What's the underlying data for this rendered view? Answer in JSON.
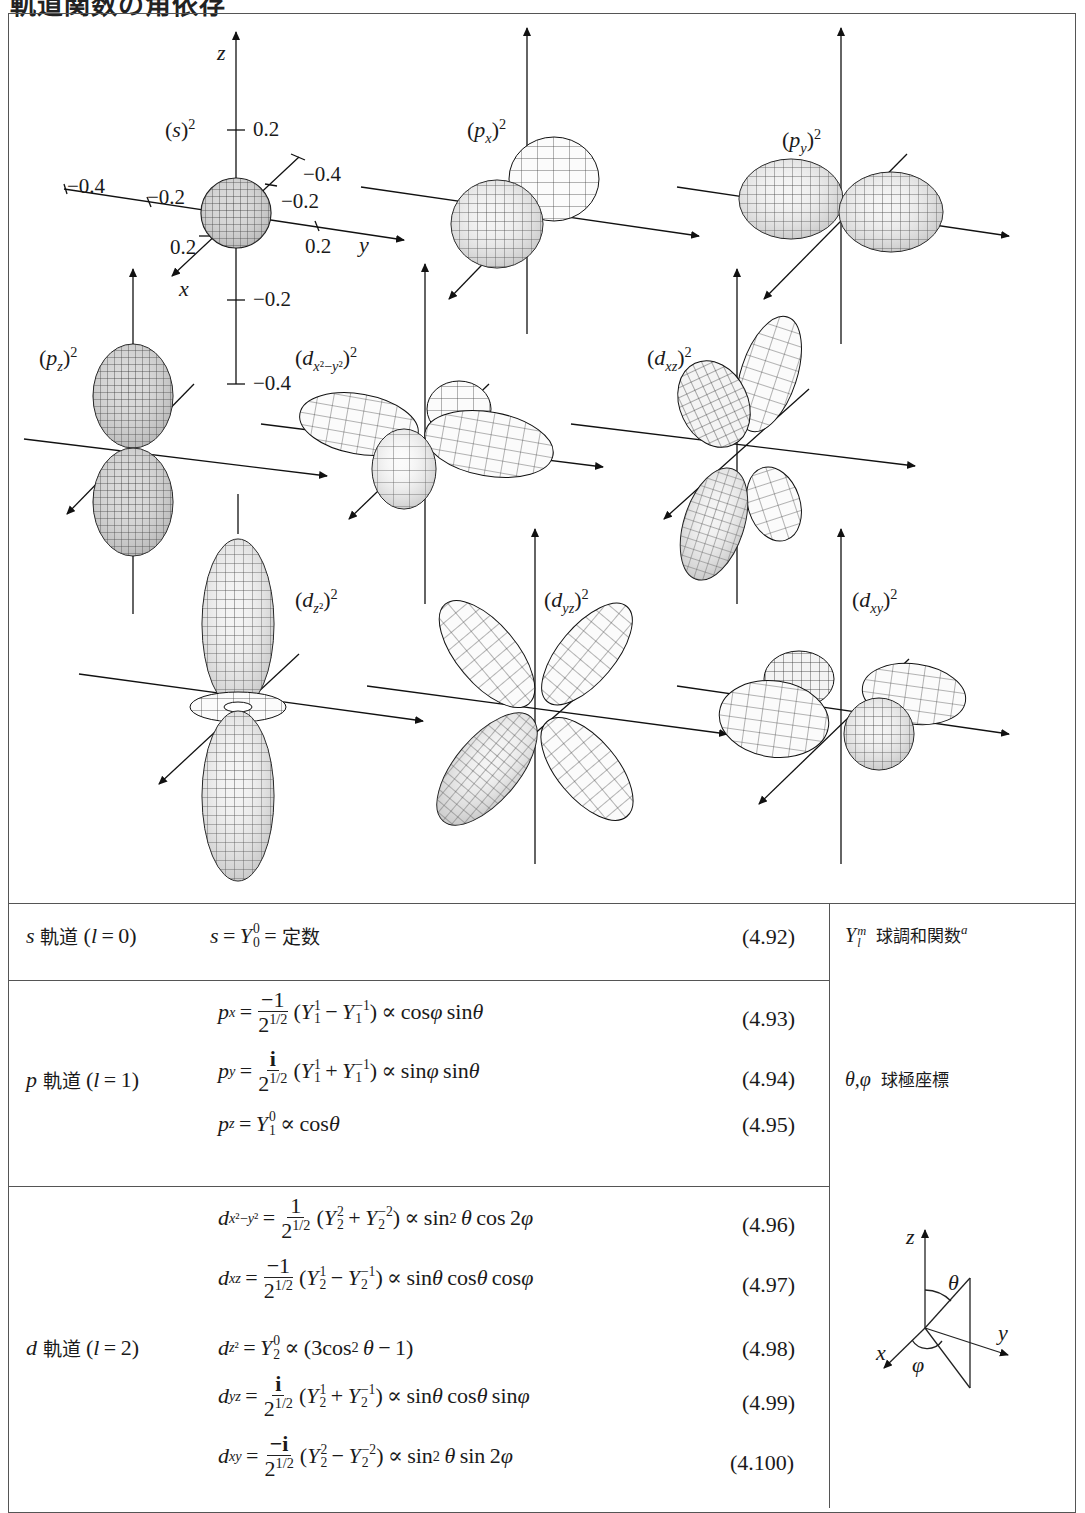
{
  "page": {
    "title": "軌道関数の角依存"
  },
  "figure": {
    "panels": [
      {
        "id": "s",
        "label": "(s)²",
        "ticks": {
          "z": [
            "0.2",
            "−0.2",
            "−0.4"
          ],
          "y": [
            "−0.4",
            "−0.2",
            "0.2"
          ],
          "x": [
            "−0.4",
            "−0.2",
            "0.2"
          ]
        },
        "axis_labels": [
          "z",
          "y",
          "x"
        ]
      },
      {
        "id": "px",
        "label": "(px)²"
      },
      {
        "id": "py",
        "label": "(py)²"
      },
      {
        "id": "pz",
        "label": "(pz)²"
      },
      {
        "id": "dx2y2",
        "label": "(dx²−y²)²"
      },
      {
        "id": "dxz",
        "label": "(dxz)²"
      },
      {
        "id": "dz2",
        "label": "(dz²)²"
      },
      {
        "id": "dyz",
        "label": "(dyz)²"
      },
      {
        "id": "dxy",
        "label": "(dxy)²"
      }
    ],
    "axis": {
      "z": "z",
      "y": "y",
      "x": "x"
    },
    "ticks": {
      "z_pos": "0.2",
      "z_neg1": "−0.2",
      "z_neg2": "−0.4",
      "y_neg2": "−0.4",
      "y_neg1": "−0.2",
      "y_pos": "0.2",
      "x_neg2": "−0.4",
      "x_neg1": "−0.2",
      "x_pos": "0.2"
    }
  },
  "table": {
    "rows": [
      {
        "name": "s 軌道 (l = 0)",
        "name_letter": "s",
        "name_kanji": "軌道",
        "name_l": "(l = 0)",
        "equations": [
          {
            "lhs": "s",
            "rhs": "= Y₀⁰ = 定数",
            "const": "定数",
            "number": "(4.92)"
          }
        ]
      },
      {
        "name": "p 軌道 (l = 1)",
        "name_letter": "p",
        "name_kanji": "軌道",
        "name_l": "(l = 1)",
        "equations": [
          {
            "lhs": "pₓ",
            "coef_num": "−1",
            "coef_den": "2^{1/2}",
            "expr": "(Y₁¹ − Y₁⁻¹)",
            "prop": "∝ cosφ sinθ",
            "number": "(4.93)"
          },
          {
            "lhs": "p_y",
            "coef_num": "i",
            "coef_den": "2^{1/2}",
            "expr": "(Y₁¹ + Y₁⁻¹)",
            "prop": "∝ sinφ sinθ",
            "number": "(4.94)"
          },
          {
            "lhs": "p_z",
            "expr": "= Y₁⁰",
            "prop": "∝ cosθ",
            "number": "(4.95)"
          }
        ]
      },
      {
        "name": "d 軌道 (l = 2)",
        "name_letter": "d",
        "name_kanji": "軌道",
        "name_l": "(l = 2)",
        "equations": [
          {
            "lhs": "d_{x²−y²}",
            "coef_num": "1",
            "coef_den": "2^{1/2}",
            "expr": "(Y₂² + Y₂⁻²)",
            "prop": "∝ sin²θ cos2φ",
            "number": "(4.96)"
          },
          {
            "lhs": "d_{xz}",
            "coef_num": "−1",
            "coef_den": "2^{1/2}",
            "expr": "(Y₂¹ − Y₂⁻¹)",
            "prop": "∝ sinθ cosθ cosφ",
            "number": "(4.97)"
          },
          {
            "lhs": "d_{z²}",
            "expr": "= Y₂⁰",
            "prop": "∝ (3cos²θ − 1)",
            "number": "(4.98)"
          },
          {
            "lhs": "d_{yz}",
            "coef_num": "i",
            "coef_den": "2^{1/2}",
            "expr": "(Y₂¹ + Y₂⁻¹)",
            "prop": "∝ sinθ cosθ sinφ",
            "number": "(4.99)"
          },
          {
            "lhs": "d_{xy}",
            "coef_num": "−i",
            "coef_den": "2^{1/2}",
            "expr": "(Y₂² − Y₂⁻²)",
            "prop": "∝ sin²θ sin2φ",
            "number": "(4.100)"
          }
        ]
      }
    ],
    "sidebar": {
      "ylm_symbol": "Y",
      "ylm_desc": "球調和関数",
      "ylm_note": "a",
      "angles_symbol": "θ,φ",
      "angles_desc": "球極座標",
      "diagram_labels": {
        "z": "z",
        "y": "y",
        "x": "x",
        "theta": "θ",
        "phi": "φ"
      }
    }
  }
}
